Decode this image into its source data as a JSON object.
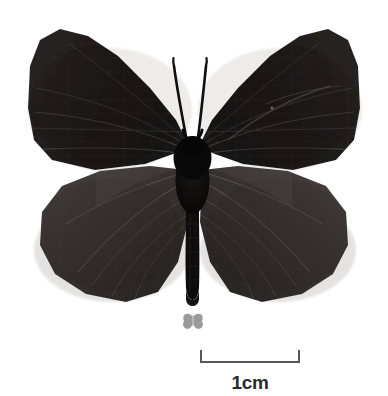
{
  "figure": {
    "view": "dorsal",
    "background_color": "#ffffff",
    "wing_color_forewing": "#231f1e",
    "wing_color_hindwing": "#3a3533",
    "body_color": "#0b0a0a",
    "antenna_color": "#141212",
    "shadow_color": "#d8d6d4"
  },
  "size_icon": {
    "name": "butterfly-size-icon",
    "color": "#9a9a9a"
  },
  "scale": {
    "label": "1cm",
    "length_cm": 1,
    "bar_color": "#58585a",
    "label_color": "#2b2b2b",
    "tick_height_px": 12,
    "bar_width_px": 100
  }
}
